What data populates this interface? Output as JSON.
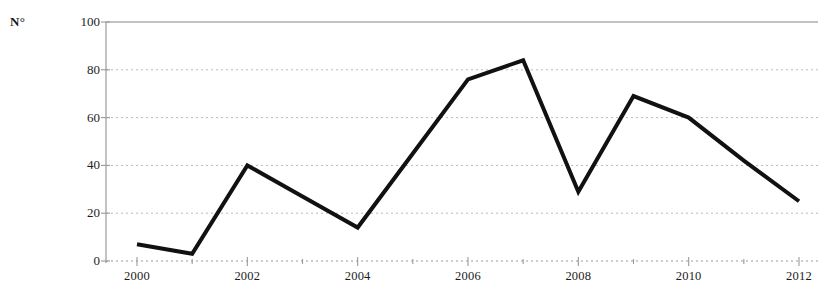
{
  "chart_data": {
    "type": "line",
    "title": "",
    "subtitle": "",
    "xlabel": "",
    "ylabel": "N°",
    "y_unit_label": "N°",
    "x": [
      2000,
      2001,
      2002,
      2003,
      2004,
      2005,
      2006,
      2007,
      2008,
      2009,
      2010,
      2011,
      2012
    ],
    "values": [
      7,
      3,
      40,
      27,
      14,
      45,
      76,
      84,
      29,
      69,
      60,
      42,
      25
    ],
    "series": [
      {
        "name": "N°",
        "color": "#111111",
        "values": [
          7,
          3,
          40,
          27,
          14,
          45,
          76,
          84,
          29,
          69,
          60,
          42,
          25
        ]
      }
    ],
    "xlim": [
      2000,
      2012
    ],
    "ylim": [
      0,
      100
    ],
    "y_ticks": [
      0,
      20,
      40,
      60,
      80,
      100
    ],
    "y_tick_labels": [
      "0",
      "20",
      "40",
      "60",
      "80",
      "100"
    ],
    "x_ticks": [
      2000,
      2002,
      2004,
      2006,
      2008,
      2010,
      2012
    ],
    "x_tick_labels": [
      "2000",
      "2002",
      "2004",
      "2006",
      "2008",
      "2010",
      "2012"
    ],
    "x_minor_ticks": [
      2001,
      2003,
      2005,
      2007,
      2009,
      2011
    ],
    "grid": true,
    "grid_style": "dotted",
    "grid_color": "#b9b9b9",
    "axis_color": "#9a9a9a",
    "legend": false,
    "legend_position": "none",
    "line_width": 4,
    "annotations": []
  },
  "axes": {
    "y_unit": "N°"
  }
}
